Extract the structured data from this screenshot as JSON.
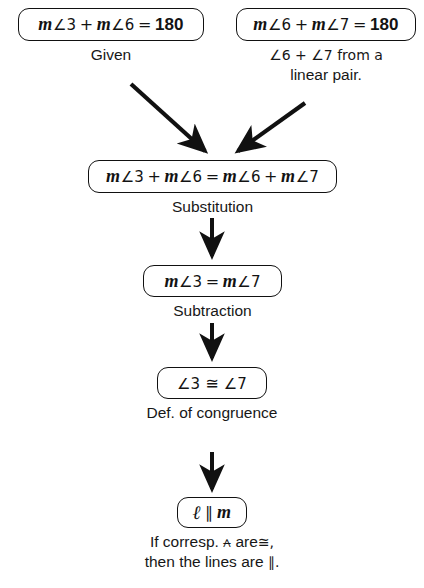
{
  "diagram": {
    "type": "flow-proof",
    "ink_color": "#111111",
    "background": "#ffffff"
  },
  "boxes": {
    "given_left": {
      "m1": "m",
      "angle1": "∠3",
      "plus": "+",
      "m2": "m",
      "angle2": "∠6",
      "equals": "=",
      "value": "180",
      "full_text": "m∠3 + m∠6 = 180"
    },
    "given_right": {
      "m1": "m",
      "angle1": "∠6",
      "plus": "+",
      "m2": "m",
      "angle2": "∠7",
      "equals": "=",
      "value": "180",
      "full_text": "m∠6 + m∠7 = 180"
    },
    "substitution": {
      "m1": "m",
      "angle1": "∠3",
      "plus1": "+",
      "m2": "m",
      "angle2": "∠6",
      "equals": "=",
      "m3": "m",
      "angle3": "∠6",
      "plus2": "+",
      "m4": "m",
      "angle4": "∠7",
      "full_text": "m∠3 + m∠6 = m∠6 + m∠7"
    },
    "subtraction": {
      "m1": "m",
      "angle1": "∠3",
      "equals": "=",
      "m2": "m",
      "angle2": "∠7",
      "full_text": "m∠3 = m∠7"
    },
    "congruence": {
      "angle1": "∠3",
      "congruent": "≅",
      "angle2": "∠7",
      "full_text": "∠3 ≅ ∠7"
    },
    "conclusion": {
      "line1": "ℓ",
      "parallel": "∥",
      "line2": "m",
      "full_text": "ℓ ∥ m"
    }
  },
  "reasons": {
    "given": "Given",
    "linear_pair_line1": "∠6 + ∠7 from a",
    "linear_pair_line2": "linear pair.",
    "substitution": "Substitution",
    "subtraction": "Subtraction",
    "def_congruence": "Def. of congruence",
    "final_line1_a": "If corresp.",
    "final_line1_sym": "⩜",
    "final_line1_b": "are",
    "final_line1_cong": "≅,",
    "final_line2_a": "then the lines are",
    "final_line2_sym": "∥."
  },
  "arrows": [
    {
      "name": "arrow-given-left-to-substitution",
      "from": "given_left",
      "to": "substitution",
      "direction": "diagonal-down-right"
    },
    {
      "name": "arrow-given-right-to-substitution",
      "from": "given_right",
      "to": "substitution",
      "direction": "diagonal-down-left"
    },
    {
      "name": "arrow-substitution-to-subtraction",
      "from": "substitution",
      "to": "subtraction",
      "direction": "down"
    },
    {
      "name": "arrow-subtraction-to-congruence",
      "from": "subtraction",
      "to": "congruence",
      "direction": "down"
    },
    {
      "name": "arrow-congruence-to-conclusion",
      "from": "congruence",
      "to": "conclusion",
      "direction": "down"
    }
  ]
}
